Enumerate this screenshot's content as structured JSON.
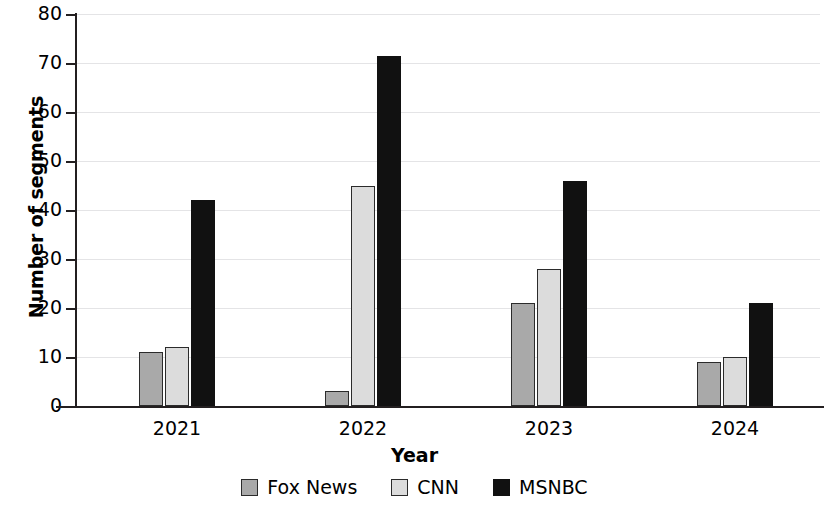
{
  "chart_data": {
    "type": "bar",
    "title": "",
    "subtitle": "",
    "xlabel": "Year",
    "ylabel": "Number of segments",
    "categories": [
      "2021",
      "2022",
      "2023",
      "2024"
    ],
    "series": [
      {
        "name": "Fox News",
        "color": "#a9a9a9",
        "values": [
          11,
          3,
          21,
          9
        ]
      },
      {
        "name": "CNN",
        "color": "#dcdcdc",
        "values": [
          12,
          45,
          28,
          10
        ]
      },
      {
        "name": "MSNBC",
        "color": "#111111",
        "values": [
          42,
          71.5,
          46,
          21
        ]
      }
    ],
    "ylim": [
      0,
      80
    ],
    "yticks": [
      0,
      10,
      20,
      30,
      40,
      50,
      60,
      70,
      80
    ],
    "ytick_labels": [
      "0",
      "10",
      "20",
      "30",
      "40",
      "50",
      "60",
      "70",
      "80"
    ],
    "grid": true,
    "grid_axis": "y",
    "legend_position": "bottom",
    "annotations": []
  },
  "legend": {
    "items": [
      {
        "label": "Fox News",
        "swatch": "fox-news-swatch"
      },
      {
        "label": "CNN",
        "swatch": "cnn-swatch"
      },
      {
        "label": "MSNBC",
        "swatch": "msnbc-swatch"
      }
    ]
  }
}
